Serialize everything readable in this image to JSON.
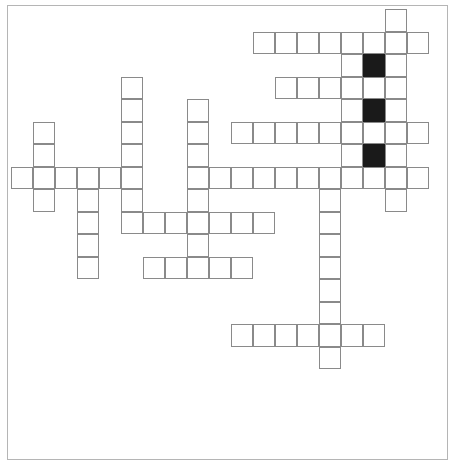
{
  "puzzle": {
    "type": "crossword",
    "origin": {
      "x": 11,
      "y": 9
    },
    "cell_width": 22,
    "cell_height": 22.5,
    "colors": {
      "cell_border": "#8a8a8a",
      "block": "#1a1a1a",
      "frame": "#b5b5b5"
    },
    "rows": [
      {
        "row": 0,
        "white": [
          17
        ],
        "black": []
      },
      {
        "row": 1,
        "white": [
          11,
          12,
          13,
          14,
          15,
          16,
          17,
          18
        ],
        "black": []
      },
      {
        "row": 2,
        "white": [
          15,
          17
        ],
        "black": [
          16
        ]
      },
      {
        "row": 3,
        "white": [
          5,
          12,
          13,
          14,
          15,
          16,
          17
        ],
        "black": []
      },
      {
        "row": 4,
        "white": [
          5,
          8,
          15,
          17
        ],
        "black": [
          16
        ]
      },
      {
        "row": 5,
        "white": [
          1,
          5,
          8,
          10,
          11,
          12,
          13,
          14,
          15,
          16,
          17,
          18
        ],
        "black": []
      },
      {
        "row": 6,
        "white": [
          1,
          5,
          8,
          15,
          17
        ],
        "black": [
          16
        ]
      },
      {
        "row": 7,
        "white": [
          0,
          1,
          2,
          3,
          4,
          5,
          8,
          9,
          10,
          11,
          12,
          13,
          14,
          15,
          16,
          17,
          18
        ],
        "black": []
      },
      {
        "row": 8,
        "white": [
          1,
          3,
          5,
          8,
          14,
          17
        ],
        "black": []
      },
      {
        "row": 9,
        "white": [
          3,
          5,
          6,
          7,
          8,
          9,
          10,
          11,
          14
        ],
        "black": []
      },
      {
        "row": 10,
        "white": [
          3,
          8,
          14
        ],
        "black": []
      },
      {
        "row": 11,
        "white": [
          3,
          6,
          7,
          8,
          9,
          10,
          14
        ],
        "black": []
      },
      {
        "row": 12,
        "white": [
          14
        ],
        "black": []
      },
      {
        "row": 13,
        "white": [
          14
        ],
        "black": []
      },
      {
        "row": 14,
        "white": [
          10,
          11,
          12,
          13,
          14,
          15,
          16
        ],
        "black": []
      },
      {
        "row": 15,
        "white": [
          14
        ],
        "black": []
      }
    ]
  }
}
